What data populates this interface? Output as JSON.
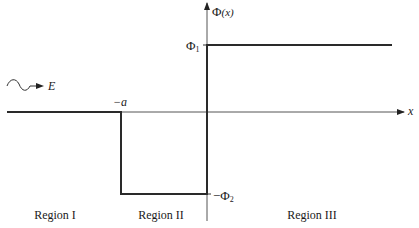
{
  "diagram": {
    "type": "potential-step-diagram",
    "axes": {
      "y_label_symbol": "Φ",
      "y_label_arg": "(x)",
      "x_label": "x"
    },
    "incident_wave": {
      "label": "E"
    },
    "levels": {
      "phi1_symbol": "Φ",
      "phi1_sub": "1",
      "phi2_prefix": "−Φ",
      "phi2_sub": "2",
      "minus_a": "−a"
    },
    "regions": [
      {
        "label": "Region I"
      },
      {
        "label": "Region II"
      },
      {
        "label": "Region III"
      }
    ],
    "colors": {
      "line": "#2a2a2a",
      "axis": "#4a4a4a"
    }
  }
}
